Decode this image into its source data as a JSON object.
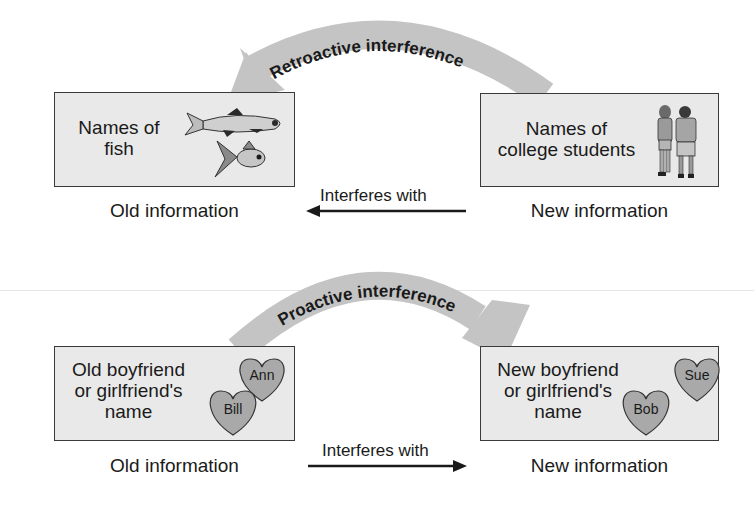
{
  "retroactive": {
    "title": "Retroactive interference",
    "left_box": {
      "lines": [
        "Names of",
        "fish"
      ],
      "caption": "Old information",
      "illustration": "fish-icon"
    },
    "right_box": {
      "lines": [
        "Names of",
        "college students"
      ],
      "caption": "New information",
      "illustration": "students-icon"
    },
    "arrow": {
      "label": "Interferes with",
      "direction": "left"
    }
  },
  "proactive": {
    "title": "Proactive interference",
    "left_box": {
      "lines": [
        "Old boyfriend",
        "or girlfriend's",
        "name"
      ],
      "caption": "Old information",
      "hearts": [
        "Ann",
        "Bill"
      ]
    },
    "right_box": {
      "lines": [
        "New boyfriend",
        "or girlfriend's",
        "name"
      ],
      "caption": "New information",
      "hearts": [
        "Sue",
        "Bob"
      ]
    },
    "arrow": {
      "label": "Interferes with",
      "direction": "right"
    }
  },
  "colors": {
    "box_fill": "#e9e9e9",
    "box_border": "#3a3a3a",
    "arc_fill": "#c4c4c4",
    "heart_fill": "#a9a9a9",
    "text": "#1a1a1a"
  }
}
